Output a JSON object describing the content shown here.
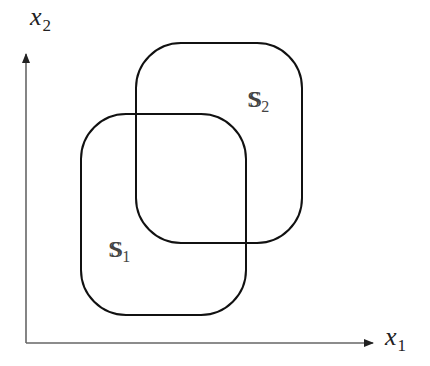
{
  "diagram": {
    "axes": {
      "x_label": {
        "base": "x",
        "subscript": "1"
      },
      "y_label": {
        "base": "x",
        "subscript": "2"
      },
      "color": "#555555"
    },
    "sets": [
      {
        "name": "S1",
        "base": "S",
        "subscript": "1",
        "box": {
          "x": 81,
          "y": 114,
          "w": 165,
          "h": 201,
          "r": 45
        }
      },
      {
        "name": "S2",
        "base": "S",
        "subscript": "2",
        "box": {
          "x": 136,
          "y": 43,
          "w": 166,
          "h": 200,
          "r": 45
        }
      }
    ],
    "stroke_color": "#111111"
  }
}
